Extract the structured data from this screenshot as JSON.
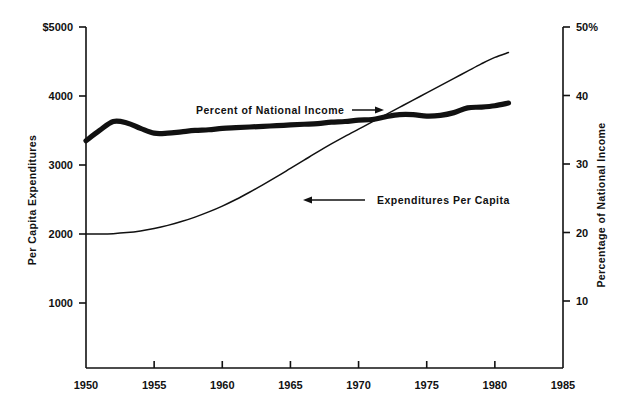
{
  "chart_data": {
    "type": "line",
    "title": "",
    "subtitle": "",
    "xlabel": "",
    "ylabel": "Per Capita Expenditures",
    "y2label": "Percentage of National Income",
    "grid": false,
    "legend_position": "inline-annotations",
    "xlim": [
      1950,
      1985
    ],
    "ylim": [
      0,
      5000
    ],
    "y2lim": [
      0,
      50
    ],
    "x_ticks": [
      1950,
      1955,
      1960,
      1965,
      1970,
      1975,
      1980,
      1985
    ],
    "x_tick_labels": [
      "1950",
      "1955",
      "1960",
      "1965",
      "1970",
      "1975",
      "1980",
      "1985"
    ],
    "y_ticks": [
      1000,
      2000,
      3000,
      4000,
      5000
    ],
    "y_tick_labels": [
      "1000",
      "2000",
      "3000",
      "4000",
      "$5000"
    ],
    "y2_ticks": [
      10,
      20,
      30,
      40,
      50
    ],
    "y2_tick_labels": [
      "10",
      "20",
      "30",
      "40",
      "50%"
    ],
    "series": [
      {
        "name": "Expenditures Per Capita",
        "axis": "left",
        "style": "thin",
        "units": "dollars per capita",
        "x": [
          1950,
          1951,
          1952,
          1953,
          1954,
          1955,
          1956,
          1957,
          1958,
          1959,
          1960,
          1961,
          1962,
          1963,
          1964,
          1965,
          1966,
          1967,
          1968,
          1969,
          1970,
          1971,
          1972,
          1973,
          1974,
          1975,
          1976,
          1977,
          1978,
          1979,
          1980,
          1981
        ],
        "values": [
          2000,
          2000,
          2005,
          2020,
          2045,
          2080,
          2125,
          2180,
          2245,
          2320,
          2405,
          2500,
          2605,
          2715,
          2830,
          2950,
          3070,
          3190,
          3305,
          3415,
          3520,
          3625,
          3730,
          3835,
          3940,
          4045,
          4150,
          4255,
          4360,
          4465,
          4560,
          4630
        ]
      },
      {
        "name": "Percent of National Income",
        "axis": "right",
        "style": "thick",
        "units": "percent of national income",
        "x": [
          1950,
          1951,
          1952,
          1953,
          1954,
          1955,
          1956,
          1957,
          1958,
          1959,
          1960,
          1961,
          1962,
          1963,
          1964,
          1965,
          1966,
          1967,
          1968,
          1969,
          1970,
          1971,
          1972,
          1973,
          1974,
          1975,
          1976,
          1977,
          1978,
          1979,
          1980,
          1981
        ],
        "values": [
          33.4,
          34.9,
          36.2,
          36.0,
          35.2,
          34.5,
          34.5,
          34.7,
          34.9,
          35.0,
          35.2,
          35.3,
          35.4,
          35.5,
          35.6,
          35.7,
          35.8,
          35.9,
          36.1,
          36.2,
          36.4,
          36.5,
          36.9,
          37.2,
          37.2,
          37.0,
          37.1,
          37.5,
          38.2,
          38.3,
          38.5,
          38.9
        ]
      }
    ],
    "annotations": [
      {
        "text": "Percent of National Income",
        "series": "Percent of National Income",
        "arrow": "right",
        "text_x": 196,
        "text_y": 114,
        "leader_from_x": 352,
        "leader_to_x": 384,
        "leader_y": 110
      },
      {
        "text": "Expenditures Per Capita",
        "series": "Expenditures Per Capita",
        "arrow": "left",
        "text_x": 377,
        "text_y": 204,
        "leader_from_x": 365,
        "leader_to_x": 303,
        "leader_y": 200
      }
    ]
  },
  "axes": {
    "left_title": "Per Capita Expenditures",
    "right_title": "Percentage of National Income"
  }
}
